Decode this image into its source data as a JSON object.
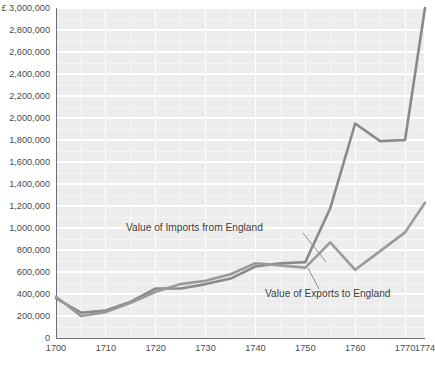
{
  "chart_data": {
    "type": "line",
    "title": "",
    "subtitle": "",
    "xlabel": "",
    "ylabel": "",
    "currency_symbol": "£",
    "y_unit_label": "£ 3,000,000",
    "ylim": [
      0,
      3000000
    ],
    "xlim": [
      1700,
      1774
    ],
    "grid": true,
    "legend_position": "inline-annotations",
    "y_ticks": [
      0,
      200000,
      400000,
      600000,
      800000,
      1000000,
      1200000,
      1400000,
      1600000,
      1800000,
      2000000,
      2200000,
      2400000,
      2600000,
      2800000,
      3000000
    ],
    "y_tick_labels": [
      "0",
      "200,000",
      "400,000",
      "600,000",
      "800,000",
      "1,000,000",
      "1,200,000",
      "1,400,000",
      "1,600,000",
      "1,800,000",
      "2,000,000",
      "2,200,000",
      "2,400,000",
      "2,600,000",
      "2,800,000",
      "3,000,000"
    ],
    "x_ticks": [
      1700,
      1710,
      1720,
      1730,
      1740,
      1750,
      1760,
      1770,
      1774
    ],
    "x_tick_labels": [
      "1700",
      "1710",
      "1720",
      "1730",
      "1740",
      "1750",
      "1760",
      "1770",
      "1774"
    ],
    "series": [
      {
        "name": "Value of Imports from England",
        "color": "#8a8a8a",
        "x": [
          1700,
          1705,
          1710,
          1715,
          1720,
          1725,
          1730,
          1735,
          1740,
          1745,
          1750,
          1755,
          1760,
          1765,
          1770,
          1774
        ],
        "values": [
          360000,
          230000,
          250000,
          330000,
          450000,
          450000,
          490000,
          540000,
          650000,
          680000,
          690000,
          1180000,
          1950000,
          1790000,
          1800000,
          3000000
        ]
      },
      {
        "name": "Value of Exports to England",
        "color": "#9a9a9a",
        "x": [
          1700,
          1705,
          1710,
          1715,
          1720,
          1725,
          1730,
          1735,
          1740,
          1745,
          1750,
          1755,
          1760,
          1765,
          1770,
          1774
        ],
        "values": [
          375000,
          200000,
          235000,
          320000,
          420000,
          490000,
          520000,
          580000,
          680000,
          660000,
          640000,
          870000,
          620000,
          790000,
          960000,
          1230000
        ]
      }
    ],
    "annotations": [
      {
        "text": "Value of Imports from England",
        "target_x": 1757,
        "target_y": 1480000
      },
      {
        "text": "Value of Exports to England",
        "target_x": 1753,
        "target_y": 740000
      }
    ]
  }
}
